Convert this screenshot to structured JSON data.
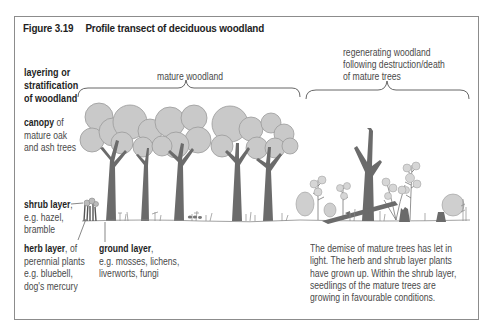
{
  "figure": {
    "number": "Figure 3.19",
    "title": "Profile transect of deciduous woodland"
  },
  "labels": {
    "layering": [
      "layering or",
      "stratification",
      "of woodland"
    ],
    "mature_woodland": "mature woodland",
    "regenerating": [
      "regenerating woodland",
      "following destruction/death",
      "of mature trees"
    ],
    "canopy": {
      "bold": "canopy",
      "rest": " of",
      "lines": [
        "mature oak",
        "and ash trees"
      ]
    },
    "shrub": {
      "bold": "shrub layer",
      "rest": ",",
      "lines": [
        "e.g. hazel,",
        "bramble"
      ]
    },
    "herb": {
      "bold": "herb layer",
      "rest": ", of",
      "lines": [
        "perennial plants",
        "e.g. bluebell,",
        "dog's mercury"
      ]
    },
    "ground": {
      "bold": "ground layer",
      "rest": ",",
      "lines": [
        "e.g. mosses, lichens,",
        "liverworts, fungi"
      ]
    },
    "demise": [
      "The demise of mature trees has let in",
      "light. The herb and shrub layer plants",
      "have grown up. Within the shrub layer,",
      "seedlings of the mature trees are",
      "growing in favourable conditions."
    ]
  },
  "colors": {
    "canopy_fill": "#c9c9c9",
    "canopy_stroke": "#9a9a9a",
    "trunk": "#6b6b6b",
    "frame": "#8c8c8c"
  }
}
